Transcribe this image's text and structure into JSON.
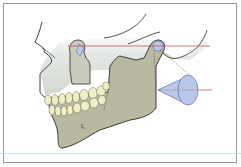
{
  "figure": {
    "colors": {
      "bone_fill": "#b8b9a0",
      "skull_shade": "#dfe3df",
      "teeth_fill": "#f0eec8",
      "outline": "#2b2b2b",
      "axis_line": "#c0443a",
      "cone_fill": "#b9c8e8",
      "cone_stroke": "#5a6fb0",
      "frame": "#9a9a9a",
      "rule": "#cfe0ec"
    },
    "elements": {
      "skull": "skull-outline",
      "mandible": "mandible",
      "teeth": "dentition",
      "condyle": "condyle",
      "axis": "horizontal-axis-line",
      "cone": "rotation-cone"
    }
  }
}
